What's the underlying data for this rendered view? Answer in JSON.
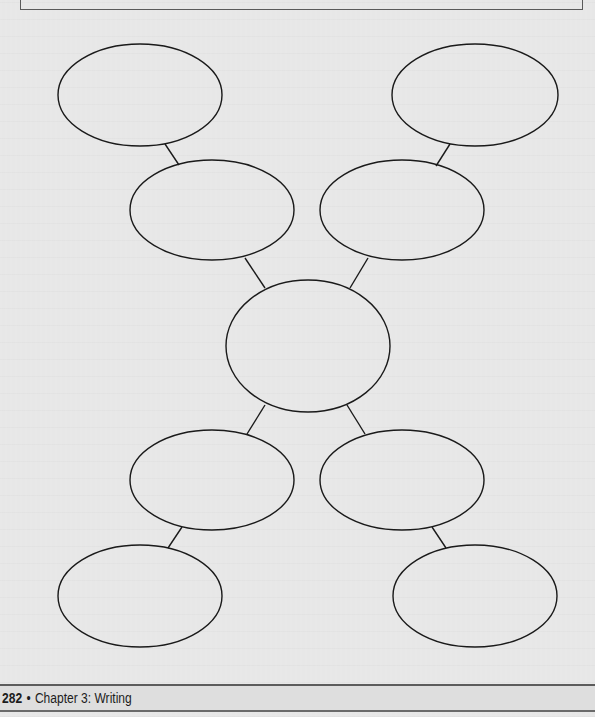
{
  "page": {
    "background_color": "#e7e7e7",
    "line_color": "#1a1a1a"
  },
  "diagram": {
    "type": "web-graphic-organizer",
    "nodes": [
      {
        "id": "top-left",
        "label": "",
        "cx": 140,
        "cy": 95,
        "rx": 82,
        "ry": 51
      },
      {
        "id": "top-right",
        "label": "",
        "cx": 475,
        "cy": 95,
        "rx": 83,
        "ry": 51
      },
      {
        "id": "upper-left",
        "label": "",
        "cx": 212,
        "cy": 210,
        "rx": 82,
        "ry": 50
      },
      {
        "id": "upper-right",
        "label": "",
        "cx": 402,
        "cy": 210,
        "rx": 82,
        "ry": 50
      },
      {
        "id": "center",
        "label": "",
        "cx": 308,
        "cy": 346,
        "rx": 82,
        "ry": 66
      },
      {
        "id": "lower-left",
        "label": "",
        "cx": 212,
        "cy": 480,
        "rx": 82,
        "ry": 50
      },
      {
        "id": "lower-right",
        "label": "",
        "cx": 402,
        "cy": 480,
        "rx": 82,
        "ry": 50
      },
      {
        "id": "bottom-left",
        "label": "",
        "cx": 140,
        "cy": 596,
        "rx": 82,
        "ry": 51
      },
      {
        "id": "bottom-right",
        "label": "",
        "cx": 475,
        "cy": 596,
        "rx": 82,
        "ry": 51
      }
    ],
    "connectors": [
      {
        "from": "top-left",
        "to": "upper-left",
        "x1": 165,
        "y1": 144,
        "x2": 179,
        "y2": 165
      },
      {
        "from": "top-right",
        "to": "upper-right",
        "x1": 450,
        "y1": 144,
        "x2": 436,
        "y2": 166
      },
      {
        "from": "upper-left",
        "to": "center",
        "x1": 245,
        "y1": 258,
        "x2": 265,
        "y2": 288
      },
      {
        "from": "upper-right",
        "to": "center",
        "x1": 368,
        "y1": 258,
        "x2": 350,
        "y2": 288
      },
      {
        "from": "center",
        "to": "lower-left",
        "x1": 265,
        "y1": 405,
        "x2": 247,
        "y2": 434
      },
      {
        "from": "center",
        "to": "lower-right",
        "x1": 347,
        "y1": 405,
        "x2": 365,
        "y2": 434
      },
      {
        "from": "lower-left",
        "to": "bottom-left",
        "x1": 182,
        "y1": 527,
        "x2": 168,
        "y2": 548
      },
      {
        "from": "lower-right",
        "to": "bottom-right",
        "x1": 432,
        "y1": 527,
        "x2": 446,
        "y2": 548
      }
    ]
  },
  "footer": {
    "page_number": "282",
    "separator": "•",
    "section": "Chapter 3: Writing"
  }
}
